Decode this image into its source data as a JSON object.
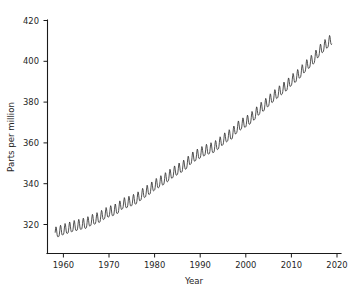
{
  "chart_data": {
    "type": "line",
    "title": "",
    "xlabel": "Year",
    "ylabel": "Parts per million",
    "xlim": [
      1956.5,
      2021.0
    ],
    "ylim": [
      312.0,
      422.0
    ],
    "xticks": [
      1960,
      1970,
      1980,
      1990,
      2000,
      2010,
      2020
    ],
    "xtick_labels": [
      "1960",
      "1970",
      "1980",
      "1990",
      "2000",
      "2010",
      "2020"
    ],
    "yticks": [
      320,
      340,
      360,
      380,
      400,
      420
    ],
    "ytick_labels": [
      "320",
      "340",
      "360",
      "380",
      "400",
      "420"
    ],
    "grid": false,
    "legend": null,
    "line_color": "#333333",
    "series": [
      {
        "name": "Atmospheric CO2 (monthly mean)",
        "description": "Monthly mean atmospheric CO2 concentration with annual seasonal cycle superimposed on rising trend",
        "x_start": 1958.2,
        "x_end": 2018.9,
        "samples_per_year": 12,
        "seasonal_amplitude_ppm": 3.1,
        "seasonal_peak_month": 5,
        "annual_means": {
          "1958": 315.3,
          "1959": 315.98,
          "1960": 316.91,
          "1961": 317.64,
          "1962": 318.45,
          "1963": 318.99,
          "1964": 319.62,
          "1965": 320.04,
          "1966": 321.37,
          "1967": 322.18,
          "1968": 323.05,
          "1969": 324.62,
          "1970": 325.68,
          "1971": 326.32,
          "1972": 327.46,
          "1973": 329.68,
          "1974": 330.19,
          "1975": 331.12,
          "1976": 332.03,
          "1977": 333.84,
          "1978": 335.41,
          "1979": 336.84,
          "1980": 338.76,
          "1981": 340.12,
          "1982": 341.48,
          "1983": 343.15,
          "1984": 344.87,
          "1985": 346.35,
          "1986": 347.61,
          "1987": 349.31,
          "1988": 351.69,
          "1989": 353.2,
          "1990": 354.45,
          "1991": 355.7,
          "1992": 356.54,
          "1993": 357.21,
          "1994": 358.96,
          "1995": 360.97,
          "1996": 362.74,
          "1997": 363.88,
          "1998": 366.84,
          "1999": 368.54,
          "2000": 369.71,
          "2001": 371.32,
          "2002": 373.45,
          "2003": 375.98,
          "2004": 377.7,
          "2005": 379.98,
          "2006": 382.09,
          "2007": 384.02,
          "2008": 385.83,
          "2009": 387.64,
          "2010": 390.1,
          "2011": 391.85,
          "2012": 394.06,
          "2013": 396.74,
          "2014": 398.81,
          "2015": 400.98,
          "2016": 404.28,
          "2017": 406.58,
          "2018": 408.71,
          "2019": 410.5
        },
        "min_value_ppm": 312.4,
        "max_value_ppm": 411.6
      }
    ]
  },
  "axes": {
    "x_axis_title": "Year",
    "y_axis_title": "Parts per million"
  }
}
